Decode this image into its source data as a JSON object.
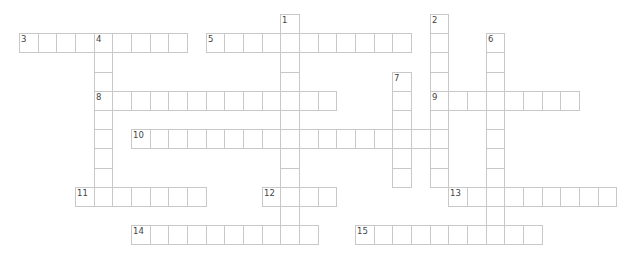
{
  "puzzle": {
    "type": "crossword",
    "grid": {
      "origin_x": 19,
      "origin_y": 14,
      "cell_w": 18.67,
      "cell_h": 19.2
    },
    "colors": {
      "border": "#c8c8c8",
      "cell_bg": "#ffffff",
      "number": "#444444"
    },
    "entries": [
      {
        "number": "1",
        "direction": "down",
        "row": 0,
        "col": 14,
        "length": 12
      },
      {
        "number": "2",
        "direction": "down",
        "row": 0,
        "col": 22,
        "length": 9
      },
      {
        "number": "3",
        "direction": "across",
        "row": 1,
        "col": 0,
        "length": 9
      },
      {
        "number": "4",
        "direction": "down",
        "row": 1,
        "col": 4,
        "length": 9
      },
      {
        "number": "5",
        "direction": "across",
        "row": 1,
        "col": 10,
        "length": 11
      },
      {
        "number": "6",
        "direction": "down",
        "row": 1,
        "col": 25,
        "length": 11
      },
      {
        "number": "7",
        "direction": "down",
        "row": 3,
        "col": 20,
        "length": 6
      },
      {
        "number": "8",
        "direction": "across",
        "row": 4,
        "col": 4,
        "length": 13
      },
      {
        "number": "9",
        "direction": "across",
        "row": 4,
        "col": 22,
        "length": 8
      },
      {
        "number": "10",
        "direction": "across",
        "row": 6,
        "col": 6,
        "length": 17
      },
      {
        "number": "11",
        "direction": "across",
        "row": 9,
        "col": 3,
        "length": 7
      },
      {
        "number": "12",
        "direction": "across",
        "row": 9,
        "col": 13,
        "length": 4
      },
      {
        "number": "13",
        "direction": "across",
        "row": 9,
        "col": 23,
        "length": 9
      },
      {
        "number": "14",
        "direction": "across",
        "row": 11,
        "col": 6,
        "length": 10
      },
      {
        "number": "15",
        "direction": "across",
        "row": 11,
        "col": 18,
        "length": 10
      }
    ]
  }
}
